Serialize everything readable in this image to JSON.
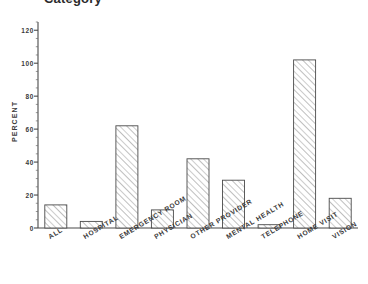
{
  "title": "Category",
  "chart_data": {
    "type": "bar",
    "title": "Category",
    "xlabel": "",
    "ylabel": "PERCENT",
    "ylim": [
      0,
      125
    ],
    "yticks": [
      0,
      20,
      40,
      60,
      80,
      100,
      120
    ],
    "ytick_labels": [
      "0",
      "20",
      "40",
      "60",
      "80",
      "100",
      "120"
    ],
    "grid": false,
    "legend": "none",
    "bar_style": "diagonal-hatch",
    "categories": [
      "ALL",
      "HOSPITAL",
      "EMERGENCY ROOM",
      "PHYSICIAN",
      "OTHER PROVIDER",
      "MENTAL HEALTH",
      "TELEPHONE",
      "HOME VISIT",
      "VISION"
    ],
    "values": [
      14,
      4,
      62,
      11,
      42,
      29,
      2,
      102,
      18
    ]
  },
  "axes": {
    "y_axis_title": "PERCENT",
    "y_tick_labels": [
      "120",
      "100",
      "80",
      "60",
      "40",
      "20",
      "0"
    ]
  }
}
